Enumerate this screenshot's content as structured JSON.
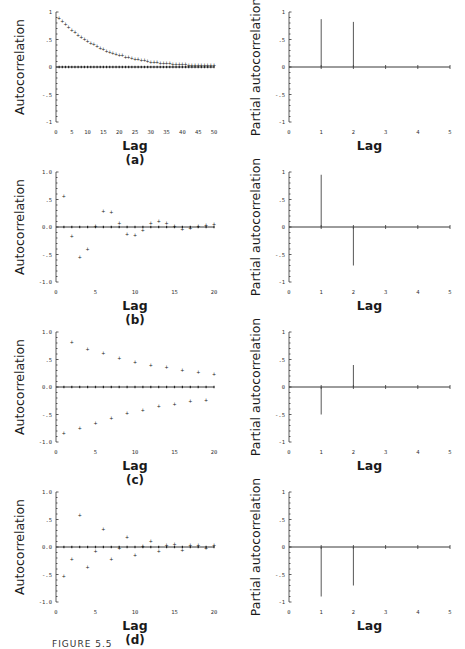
{
  "figure": {
    "caption_fragment": "FIGURE 5.5",
    "panels": [
      "(a)",
      "(b)",
      "(c)",
      "(d)"
    ]
  },
  "chart_data": [
    {
      "id": "a-acf",
      "type": "scatter",
      "panel": "(a)",
      "title": "",
      "xlabel": "Lag",
      "ylabel": "Autocorrelation",
      "xlim": [
        0,
        50
      ],
      "ylim": [
        -1,
        1
      ],
      "xticks": [
        "0",
        "5",
        "10",
        "15",
        "20",
        "25",
        "30",
        "35",
        "40",
        "45",
        "50"
      ],
      "yticks": [
        {
          "v": 1,
          "t": "1"
        },
        {
          "v": 0.5,
          "t": ".5"
        },
        {
          "v": 0,
          "t": "0"
        },
        {
          "v": -0.5,
          "t": "-.5"
        },
        {
          "v": -1,
          "t": "-1"
        }
      ],
      "formula": "0.9^k",
      "x": [
        1,
        2,
        3,
        4,
        5,
        6,
        7,
        8,
        9,
        10,
        11,
        12,
        13,
        14,
        15,
        16,
        17,
        18,
        19,
        20,
        21,
        22,
        23,
        24,
        25,
        26,
        27,
        28,
        29,
        30,
        31,
        32,
        33,
        34,
        35,
        36,
        37,
        38,
        39,
        40,
        41,
        42,
        43,
        44,
        45,
        46,
        47,
        48,
        49,
        50
      ],
      "values": [
        0.9,
        0.84,
        0.78,
        0.73,
        0.68,
        0.63,
        0.59,
        0.55,
        0.51,
        0.47,
        0.44,
        0.41,
        0.38,
        0.35,
        0.33,
        0.3,
        0.28,
        0.26,
        0.24,
        0.22,
        0.21,
        0.19,
        0.18,
        0.16,
        0.15,
        0.14,
        0.13,
        0.12,
        0.11,
        0.1,
        0.09,
        0.085,
        0.08,
        0.075,
        0.07,
        0.065,
        0.06,
        0.055,
        0.05,
        0.048,
        0.046,
        0.044,
        0.042,
        0.04,
        0.038,
        0.036,
        0.035,
        0.034,
        0.033,
        0.032
      ],
      "grid": false
    },
    {
      "id": "a-pacf",
      "type": "bar",
      "panel": "(a)",
      "xlabel": "Lag",
      "ylabel": "Partial autocorrelation",
      "xlim": [
        0,
        5
      ],
      "ylim": [
        -1,
        1
      ],
      "xticks": [
        "0",
        "1",
        "2",
        "3",
        "4",
        "5"
      ],
      "yticks": [
        {
          "v": 1,
          "t": "1"
        },
        {
          "v": 0.5,
          "t": ".5"
        },
        {
          "v": 0,
          "t": "0"
        },
        {
          "v": -0.5,
          "t": "-.5"
        },
        {
          "v": -1,
          "t": "-1"
        }
      ],
      "categories": [
        1,
        2,
        3,
        4,
        5
      ],
      "values": [
        0.87,
        0.82,
        0,
        0,
        0
      ],
      "grid": false
    },
    {
      "id": "b-acf",
      "type": "scatter",
      "panel": "(b)",
      "xlabel": "Lag",
      "ylabel": "Autocorrelation",
      "xlim": [
        0,
        20
      ],
      "ylim": [
        -1,
        1
      ],
      "xticks": [
        "0",
        "5",
        "10",
        "15",
        "20"
      ],
      "yticks": [
        {
          "v": 1,
          "t": "1.0"
        },
        {
          "v": 0.5,
          "t": ".5"
        },
        {
          "v": 0,
          "t": "0.0"
        },
        {
          "v": -0.5,
          "t": "-.5"
        },
        {
          "v": -1,
          "t": "-1.0"
        }
      ],
      "x": [
        1,
        2,
        3,
        4,
        5,
        6,
        7,
        8,
        9,
        10,
        11,
        12,
        13,
        14,
        15,
        16,
        17,
        18,
        19,
        20
      ],
      "values": [
        0.56,
        -0.17,
        -0.55,
        -0.4,
        0.02,
        0.29,
        0.28,
        0.07,
        -0.12,
        -0.15,
        -0.05,
        0.07,
        0.11,
        0.07,
        0.01,
        -0.03,
        -0.01,
        0.02,
        0.04,
        0.05
      ],
      "grid": false
    },
    {
      "id": "b-pacf",
      "type": "bar",
      "panel": "(b)",
      "xlabel": "Lag",
      "ylabel": "Partial autocorrelation",
      "xlim": [
        0,
        5
      ],
      "ylim": [
        -1,
        1
      ],
      "xticks": [
        "0",
        "1",
        "2",
        "3",
        "4",
        "5"
      ],
      "yticks": [
        {
          "v": 1,
          "t": "1"
        },
        {
          "v": 0.5,
          "t": ".5"
        },
        {
          "v": 0,
          "t": "0"
        },
        {
          "v": -0.5,
          "t": "-.5"
        },
        {
          "v": -1,
          "t": "-1"
        }
      ],
      "categories": [
        1,
        2,
        3,
        4,
        5
      ],
      "values": [
        0.95,
        -0.7,
        0,
        0,
        0
      ],
      "grid": false
    },
    {
      "id": "c-acf",
      "type": "scatter",
      "panel": "(c)",
      "xlabel": "Lag",
      "ylabel": "Autocorrelation",
      "xlim": [
        0,
        20
      ],
      "ylim": [
        -1,
        1
      ],
      "xticks": [
        "0",
        "5",
        "10",
        "15",
        "20"
      ],
      "yticks": [
        {
          "v": 1,
          "t": "1.0"
        },
        {
          "v": 0.5,
          "t": ".5"
        },
        {
          "v": 0,
          "t": "0.0"
        },
        {
          "v": -0.5,
          "t": "-.5"
        },
        {
          "v": -1,
          "t": "-1.0"
        }
      ],
      "x": [
        1,
        2,
        3,
        4,
        5,
        6,
        7,
        8,
        9,
        10,
        11,
        12,
        13,
        14,
        15,
        16,
        17,
        18,
        19,
        20
      ],
      "values": [
        -0.84,
        0.82,
        -0.75,
        0.7,
        -0.65,
        0.61,
        -0.56,
        0.53,
        -0.48,
        0.46,
        -0.42,
        0.4,
        -0.35,
        0.36,
        -0.3,
        0.31,
        -0.26,
        0.27,
        -0.23,
        0.24
      ],
      "grid": false
    },
    {
      "id": "c-pacf",
      "type": "bar",
      "panel": "(c)",
      "xlabel": "Lag",
      "ylabel": "Partial autocorrelation",
      "xlim": [
        0,
        5
      ],
      "ylim": [
        -1,
        1
      ],
      "xticks": [
        "0",
        "1",
        "2",
        "3",
        "4",
        "5"
      ],
      "yticks": [
        {
          "v": 1,
          "t": "1"
        },
        {
          "v": 0.5,
          "t": ".5"
        },
        {
          "v": 0,
          "t": "0"
        },
        {
          "v": -0.5,
          "t": "-.5"
        },
        {
          "v": -1,
          "t": "-1"
        }
      ],
      "categories": [
        1,
        2,
        3,
        4,
        5
      ],
      "values": [
        -0.5,
        0.4,
        0,
        0,
        0
      ],
      "grid": false
    },
    {
      "id": "d-acf",
      "type": "scatter",
      "panel": "(d)",
      "xlabel": "Lag",
      "ylabel": "Autocorrelation",
      "xlim": [
        0,
        20
      ],
      "ylim": [
        -1,
        1
      ],
      "xticks": [
        "0",
        "5",
        "10",
        "15",
        "20"
      ],
      "yticks": [
        {
          "v": 1,
          "t": "1.0"
        },
        {
          "v": 0.5,
          "t": ".5"
        },
        {
          "v": 0,
          "t": "0.0"
        },
        {
          "v": -0.5,
          "t": "-.5"
        },
        {
          "v": -1,
          "t": "-1.0"
        }
      ],
      "x": [
        1,
        2,
        3,
        4,
        5,
        6,
        7,
        8,
        9,
        10,
        11,
        12,
        13,
        14,
        15,
        16,
        17,
        18,
        19,
        20
      ],
      "values": [
        -0.53,
        -0.22,
        0.58,
        -0.36,
        -0.08,
        0.33,
        -0.22,
        -0.01,
        0.19,
        -0.14,
        0.02,
        0.11,
        -0.08,
        0.03,
        0.06,
        -0.05,
        0.03,
        0.03,
        -0.01,
        0.03
      ],
      "grid": false
    },
    {
      "id": "d-pacf",
      "type": "bar",
      "panel": "(d)",
      "xlabel": "Lag",
      "ylabel": "Partial autocorrelation",
      "xlim": [
        0,
        5
      ],
      "ylim": [
        -1,
        1
      ],
      "xticks": [
        "0",
        "1",
        "2",
        "3",
        "4",
        "5"
      ],
      "yticks": [
        {
          "v": 1,
          "t": "1"
        },
        {
          "v": 0.5,
          "t": ".5"
        },
        {
          "v": 0,
          "t": "0"
        },
        {
          "v": -0.5,
          "t": "-.5"
        },
        {
          "v": -1,
          "t": "-1"
        }
      ],
      "categories": [
        1,
        2,
        3,
        4,
        5
      ],
      "values": [
        -0.9,
        -0.7,
        0,
        0,
        0
      ],
      "grid": false
    }
  ]
}
